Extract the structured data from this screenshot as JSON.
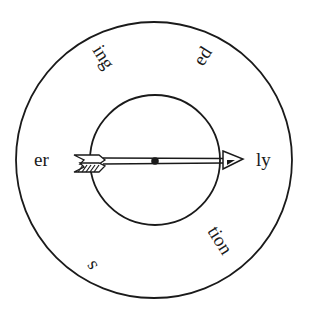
{
  "diagram": {
    "type": "suffix-spinner",
    "center_label": "",
    "suffixes": [
      {
        "id": "er",
        "text": "er"
      },
      {
        "id": "ing",
        "text": "ing"
      },
      {
        "id": "ed",
        "text": "ed"
      },
      {
        "id": "ly",
        "text": "ly"
      },
      {
        "id": "tion",
        "text": "tion"
      },
      {
        "id": "s",
        "text": "s"
      }
    ],
    "arrow_points_to": "ly",
    "colors": {
      "stroke": "#1a1a1a",
      "background": "#ffffff"
    }
  }
}
